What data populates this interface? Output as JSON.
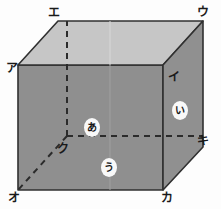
{
  "figure": {
    "type": "cube-diagram",
    "background_color": "#fdfdfd",
    "colors": {
      "top_face": "#c6c6c6",
      "front_face": "#8f8f8f",
      "right_face": "#909090",
      "edge_stroke": "#303030",
      "hidden_edge_stroke": "#2b2b2b",
      "label_text": "#1a1a1a",
      "face_label_bg": "#f8f8f8"
    },
    "vertex_labels": [
      {
        "id": "a",
        "text": "ア",
        "x": 6,
        "y": 62,
        "desc": "front-top-left"
      },
      {
        "id": "i",
        "text": "イ",
        "x": 168,
        "y": 71,
        "desc": "front-top-right"
      },
      {
        "id": "u",
        "text": "ウ",
        "x": 197,
        "y": 6,
        "desc": "back-top-right"
      },
      {
        "id": "e",
        "text": "エ",
        "x": 48,
        "y": 7,
        "desc": "back-top-left"
      },
      {
        "id": "o",
        "text": "オ",
        "x": 8,
        "y": 192,
        "desc": "front-bottom-left"
      },
      {
        "id": "ka",
        "text": "カ",
        "x": 161,
        "y": 192,
        "desc": "front-bottom-right"
      },
      {
        "id": "ki",
        "text": "キ",
        "x": 197,
        "y": 135,
        "desc": "back-bottom-right"
      },
      {
        "id": "ku",
        "text": "ク",
        "x": 57,
        "y": 143,
        "desc": "back-bottom-left hidden"
      }
    ],
    "face_labels": [
      {
        "id": "face-a",
        "text": "あ",
        "x": 84,
        "y": 118,
        "desc": "back-top inner face"
      },
      {
        "id": "face-i",
        "text": "い",
        "x": 172,
        "y": 101,
        "desc": "right face"
      },
      {
        "id": "face-u",
        "text": "う",
        "x": 101,
        "y": 158,
        "desc": "bottom inner face"
      }
    ],
    "geometry": {
      "front_face_points": "18,65 163,65 163,190 18,190",
      "top_face_points": "18,65 58,21 203,21 163,65",
      "right_face_points": "163,65 203,21 203,147 163,190",
      "hidden_vertex": {
        "x": 67,
        "y": 136
      },
      "hidden_edges": [
        {
          "from": [
            67,
            136
          ],
          "to": [
            67,
            21
          ],
          "desc": "ku-to-e vertical"
        },
        {
          "from": [
            67,
            136
          ],
          "to": [
            203,
            136
          ],
          "desc": "ku-to-ki horizontal"
        },
        {
          "from": [
            67,
            136
          ],
          "to": [
            18,
            190
          ],
          "desc": "ku-to-o diagonal"
        }
      ]
    }
  }
}
